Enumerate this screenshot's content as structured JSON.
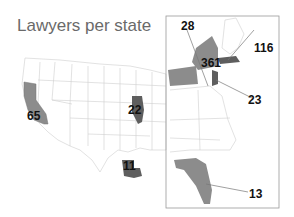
{
  "title": "Lawyers per state",
  "colors": {
    "highlight_light": "#8c8c8c",
    "highlight_dark": "#5e5e5e",
    "borders": "#c8c8c8",
    "inset_frame": "#9a9a9a"
  },
  "states": [
    {
      "state": "California",
      "value": "65",
      "shade": "light"
    },
    {
      "state": "Illinois",
      "value": "22",
      "shade": "dark"
    },
    {
      "state": "Louisiana",
      "value": "11",
      "shade": "dark"
    },
    {
      "state": "Pennsylvania",
      "value": "28",
      "shade": "light"
    },
    {
      "state": "New York",
      "value": "361",
      "shade": "light"
    },
    {
      "state": "Massachusetts",
      "value": "116",
      "shade": "dark"
    },
    {
      "state": "New Jersey",
      "value": "23",
      "shade": "dark"
    },
    {
      "state": "Florida",
      "value": "13",
      "shade": "light"
    }
  ]
}
